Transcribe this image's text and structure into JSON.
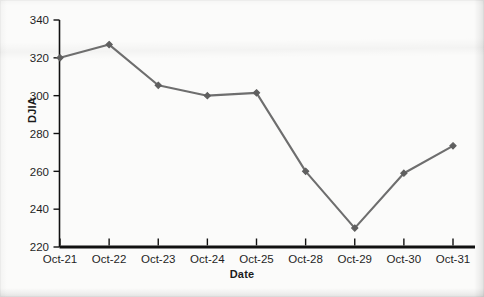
{
  "chart_data": {
    "type": "line",
    "title": "",
    "xlabel": "Date",
    "ylabel": "DJIA",
    "categories": [
      "Oct-21",
      "Oct-22",
      "Oct-23",
      "Oct-24",
      "Oct-25",
      "Oct-28",
      "Oct-29",
      "Oct-30",
      "Oct-31"
    ],
    "values": [
      320,
      327,
      305.5,
      300,
      301.5,
      260,
      230,
      259,
      273.5
    ],
    "series": [
      {
        "name": "DJIA",
        "values": [
          320,
          327,
          305.5,
          300,
          301.5,
          260,
          230,
          259,
          273.5
        ],
        "color": "#6e6e6e",
        "marker": "diamond",
        "marker_color": "#5f5f5f"
      }
    ],
    "ylim": [
      220,
      340
    ],
    "yticks": [
      220,
      240,
      260,
      280,
      300,
      320,
      340
    ],
    "ytick_labels": [
      "220",
      "240",
      "260",
      "280",
      "300",
      "320",
      "340"
    ],
    "xtick_labels": [
      "Oct-21",
      "Oct-22",
      "Oct-23",
      "Oct-24",
      "Oct-25",
      "Oct-28",
      "Oct-29",
      "Oct-30",
      "Oct-31"
    ],
    "grid": false,
    "legend": false,
    "legend_position": "none",
    "axis_color": "#111111",
    "background_color": "#fbfbfa"
  },
  "axes": {
    "y_title": "DJIA",
    "x_title": "Date"
  }
}
